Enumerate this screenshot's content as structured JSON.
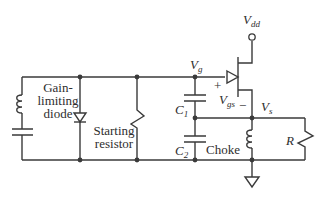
{
  "diagram": {
    "type": "circuit-schematic",
    "title": "",
    "labels": {
      "gain_limiting_diode": [
        "Gain-",
        "limiting",
        "diode"
      ],
      "starting_resistor": [
        "Starting",
        "resistor"
      ],
      "vdd": {
        "main": "V",
        "sub": "dd"
      },
      "vg": {
        "main": "V",
        "sub": "g"
      },
      "vgs": {
        "main": "V",
        "sub": "gs"
      },
      "vs": {
        "main": "V",
        "sub": "s"
      },
      "plus": "+",
      "minus": "−",
      "c1": {
        "main": "C",
        "sub": "1"
      },
      "c2": {
        "main": "C",
        "sub": "2"
      },
      "choke": "Choke",
      "r": "R"
    },
    "components": [
      {
        "id": "tank-inductor",
        "kind": "inductor"
      },
      {
        "id": "tank-capacitor",
        "kind": "capacitor"
      },
      {
        "id": "gain-limiting-diode",
        "kind": "diode"
      },
      {
        "id": "starting-resistor",
        "kind": "resistor"
      },
      {
        "id": "c1",
        "kind": "capacitor"
      },
      {
        "id": "c2",
        "kind": "capacitor"
      },
      {
        "id": "jfet",
        "kind": "transistor"
      },
      {
        "id": "choke",
        "kind": "inductor"
      },
      {
        "id": "r-load",
        "kind": "resistor"
      },
      {
        "id": "vdd-terminal",
        "kind": "terminal"
      },
      {
        "id": "ground",
        "kind": "ground"
      }
    ],
    "colors": {
      "line": "#3a3a3a",
      "text": "#2e2e2e",
      "background": "#ffffff"
    }
  }
}
